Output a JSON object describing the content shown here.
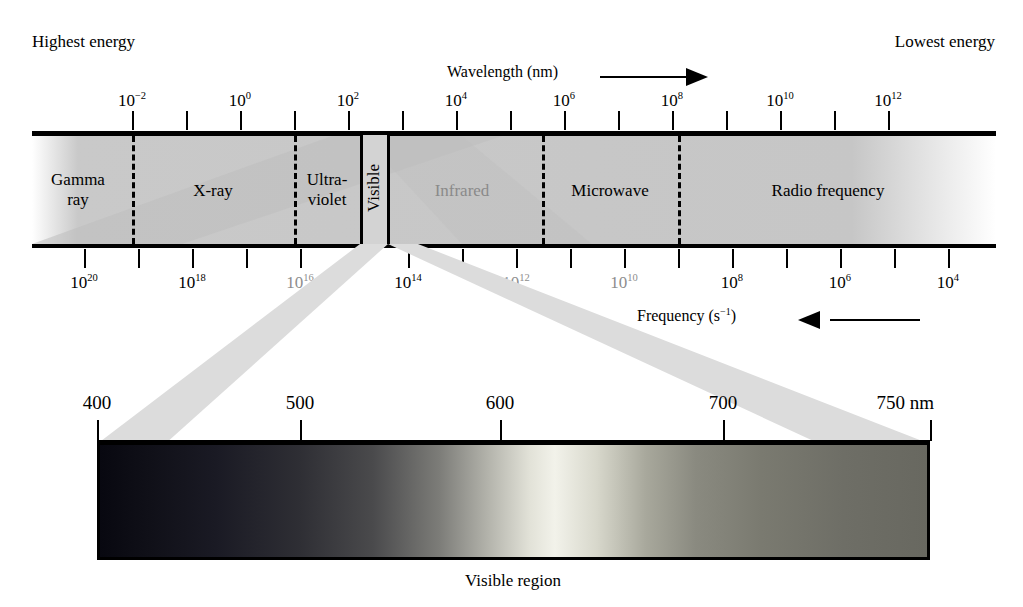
{
  "figure": {
    "caption": "Visible region",
    "energy_left": "Highest energy",
    "energy_right": "Lowest energy"
  },
  "wavelength_axis": {
    "title": "Wavelength (nm)",
    "arrow": "right-arrow-icon",
    "labels": [
      "10-2",
      "10-0",
      "10-2b",
      "10-4",
      "10-6",
      "10-8",
      "10-10",
      "10-12"
    ],
    "ticks": [
      {
        "label_base": "10",
        "exp": "−2",
        "x": 132,
        "labeled": true
      },
      {
        "label_base": "",
        "exp": "",
        "x": 186,
        "labeled": false
      },
      {
        "label_base": "10",
        "exp": "0",
        "x": 240,
        "labeled": true
      },
      {
        "label_base": "",
        "exp": "",
        "x": 294,
        "labeled": false
      },
      {
        "label_base": "10",
        "exp": "2",
        "x": 348,
        "labeled": true
      },
      {
        "label_base": "",
        "exp": "",
        "x": 402,
        "labeled": false
      },
      {
        "label_base": "10",
        "exp": "4",
        "x": 456,
        "labeled": true
      },
      {
        "label_base": "",
        "exp": "",
        "x": 510,
        "labeled": false
      },
      {
        "label_base": "10",
        "exp": "6",
        "x": 564,
        "labeled": true
      },
      {
        "label_base": "",
        "exp": "",
        "x": 618,
        "labeled": false
      },
      {
        "label_base": "10",
        "exp": "8",
        "x": 672,
        "labeled": true
      },
      {
        "label_base": "",
        "exp": "",
        "x": 726,
        "labeled": false
      },
      {
        "label_base": "10",
        "exp": "10",
        "x": 780,
        "labeled": true
      },
      {
        "label_base": "",
        "exp": "",
        "x": 834,
        "labeled": false
      },
      {
        "label_base": "10",
        "exp": "12",
        "x": 888,
        "labeled": true
      }
    ]
  },
  "frequency_axis": {
    "title": "Frequency (s−1)",
    "title_base": "Frequency (s",
    "title_exp": "−1",
    "title_tail": ")",
    "arrow": "left-arrow-icon",
    "ticks": [
      {
        "label_base": "10",
        "exp": "20",
        "x": 84,
        "labeled": true,
        "dim": false
      },
      {
        "label_base": "",
        "exp": "",
        "x": 138,
        "labeled": false,
        "dim": false
      },
      {
        "label_base": "10",
        "exp": "18",
        "x": 192,
        "labeled": true,
        "dim": false
      },
      {
        "label_base": "",
        "exp": "",
        "x": 246,
        "labeled": false,
        "dim": false
      },
      {
        "label_base": "10",
        "exp": "16",
        "x": 300,
        "labeled": true,
        "dim": true
      },
      {
        "label_base": "",
        "exp": "",
        "x": 354,
        "labeled": false,
        "dim": false
      },
      {
        "label_base": "10",
        "exp": "14",
        "x": 408,
        "labeled": true,
        "dim": false
      },
      {
        "label_base": "",
        "exp": "",
        "x": 462,
        "labeled": false,
        "dim": false
      },
      {
        "label_base": "10",
        "exp": "12",
        "x": 516,
        "labeled": true,
        "dim": true
      },
      {
        "label_base": "",
        "exp": "",
        "x": 570,
        "labeled": false,
        "dim": false
      },
      {
        "label_base": "10",
        "exp": "10",
        "x": 624,
        "labeled": true,
        "dim": true
      },
      {
        "label_base": "",
        "exp": "",
        "x": 678,
        "labeled": false,
        "dim": false
      },
      {
        "label_base": "10",
        "exp": "8",
        "x": 732,
        "labeled": true,
        "dim": false
      },
      {
        "label_base": "",
        "exp": "",
        "x": 786,
        "labeled": false,
        "dim": false
      },
      {
        "label_base": "10",
        "exp": "6",
        "x": 840,
        "labeled": true,
        "dim": false
      },
      {
        "label_base": "",
        "exp": "",
        "x": 894,
        "labeled": false,
        "dim": false
      },
      {
        "label_base": "10",
        "exp": "4",
        "x": 948,
        "labeled": true,
        "dim": false
      }
    ]
  },
  "regions": [
    {
      "name": "Gamma ray",
      "line1": "Gamma",
      "line2": "ray",
      "center": 78,
      "dim": false,
      "two_line": true
    },
    {
      "name": "X-ray",
      "line1": "X-ray",
      "line2": "",
      "center": 213,
      "dim": false,
      "two_line": false
    },
    {
      "name": "Ultraviolet",
      "line1": "Ultra-",
      "line2": "violet",
      "center": 327,
      "dim": false,
      "two_line": true
    },
    {
      "name": "Visible",
      "line1": "Visible",
      "line2": "",
      "center": 374,
      "dim": false,
      "two_line": false
    },
    {
      "name": "Infrared",
      "line1": "Infrared",
      "line2": "",
      "center": 462,
      "dim": true,
      "two_line": false
    },
    {
      "name": "Microwave",
      "line1": "Microwave",
      "line2": "",
      "center": 610,
      "dim": false,
      "two_line": false
    },
    {
      "name": "Radio frequency",
      "line1": "Radio frequency",
      "line2": "",
      "center": 828,
      "dim": false,
      "two_line": false
    }
  ],
  "dividers": [
    132,
    294,
    542,
    678
  ],
  "visible_box": {
    "left": 360,
    "right": 390,
    "label": "Visible"
  },
  "visible_scale": {
    "unit_suffix": "nm",
    "ticks": [
      {
        "label": "400",
        "x": 97,
        "end": false
      },
      {
        "label": "500",
        "x": 300,
        "end": false
      },
      {
        "label": "600",
        "x": 500,
        "end": false
      },
      {
        "label": "700",
        "x": 723,
        "end": false
      },
      {
        "label": "750 nm",
        "x": 930,
        "end": true
      }
    ]
  },
  "chart_data": {
    "type": "diagram",
    "xlabel": "Wavelength (nm)",
    "ylabel": "",
    "secondary_xlabel": "Frequency (s−1)",
    "wavelength_ticks_nm": [
      0.01,
      1,
      100,
      10000,
      1000000,
      100000000,
      10000000000,
      1000000000000
    ],
    "wavelength_tick_labels": [
      "10⁻²",
      "10⁰",
      "10²",
      "10⁴",
      "10⁶",
      "10⁸",
      "10¹⁰",
      "10¹²"
    ],
    "frequency_ticks_hz": [
      1e+20,
      1e+18,
      1e+16,
      100000000000000.0,
      1000000000000.0,
      10000000000.0,
      100000000.0,
      1000000.0,
      10000.0
    ],
    "frequency_tick_labels": [
      "10²⁰",
      "10¹⁸",
      "10¹⁶",
      "10¹⁴",
      "10¹²",
      "10¹⁰",
      "10⁸",
      "10⁶",
      "10⁴"
    ],
    "bands": [
      {
        "name": "Gamma ray",
        "wavelength_range_nm": [
          0.0001,
          0.01
        ]
      },
      {
        "name": "X-ray",
        "wavelength_range_nm": [
          0.01,
          10
        ]
      },
      {
        "name": "Ultraviolet",
        "wavelength_range_nm": [
          10,
          400
        ]
      },
      {
        "name": "Visible",
        "wavelength_range_nm": [
          400,
          750
        ]
      },
      {
        "name": "Infrared",
        "wavelength_range_nm": [
          750,
          1000000
        ]
      },
      {
        "name": "Microwave",
        "wavelength_range_nm": [
          1000000,
          100000000
        ]
      },
      {
        "name": "Radio frequency",
        "wavelength_range_nm": [
          100000000,
          100000000000000
        ]
      }
    ],
    "visible_detail_ticks_nm": [
      400,
      500,
      600,
      700,
      750
    ],
    "visible_detail_labels": [
      "400",
      "500",
      "600",
      "700",
      "750 nm"
    ],
    "annotations": [
      "Highest energy",
      "Lowest energy",
      "Visible region"
    ],
    "grid": false,
    "legend": "none"
  }
}
